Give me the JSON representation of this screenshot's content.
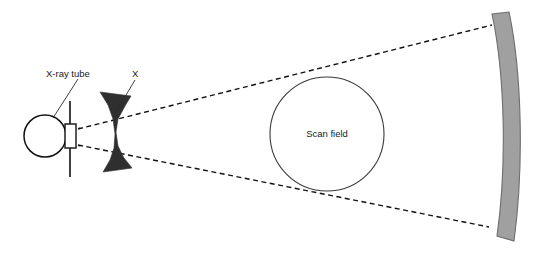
{
  "figure": {
    "background_color": "#ffffff",
    "width": 544,
    "height": 255
  },
  "labels": {
    "xray_tube": "X-ray tube",
    "bowtie_filter": "X",
    "scan_field": "Scan field"
  },
  "colors": {
    "line": "#111111",
    "outline": "#2b2b2b",
    "bowtie_fill": "#2f2f2f",
    "detector_fill": "#a0a0a0",
    "detector_stroke": "#6d6d6d",
    "scan_field_stroke": "#3a3a3a",
    "background": "#ffffff"
  },
  "geometry": {
    "focal_spot": {
      "x": 43,
      "y": 136
    },
    "tube_circle": {
      "cx": 45,
      "cy": 136,
      "r": 21
    },
    "anode_line": {
      "x": 70,
      "y1": 102,
      "y2": 176
    },
    "collimator_box": {
      "x": 65,
      "y": 124,
      "w": 11,
      "h": 24
    },
    "scan_field_circle": {
      "cx": 327,
      "cy": 134,
      "r": 57
    },
    "upper_ray": {
      "x1": 50,
      "y1": 132,
      "x2": 493,
      "y2": 24
    },
    "lower_ray": {
      "x1": 50,
      "y1": 143,
      "x2": 490,
      "y2": 228
    },
    "detector_arc": {
      "top_x": 492,
      "top_y": 14,
      "bottom_x": 497,
      "bottom_y": 236,
      "thickness": 16
    }
  }
}
